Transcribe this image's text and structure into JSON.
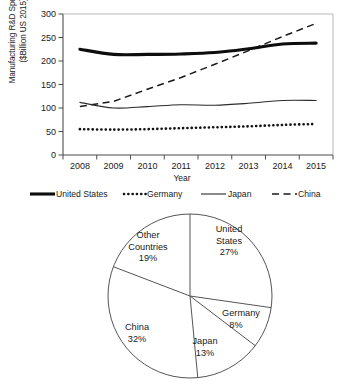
{
  "chart_data": [
    {
      "type": "line",
      "title": "",
      "xlabel": "Year",
      "ylabel": "Manufacturing R&D Spending ($Billion US 2015)",
      "ylabel_line1": "Manufacturing R&D Spending",
      "ylabel_line2": "($Billion US 2015)",
      "x": [
        2008,
        2009,
        2010,
        2011,
        2012,
        2013,
        2014,
        2015
      ],
      "categories": [
        "2008",
        "2009",
        "2010",
        "2011",
        "2012",
        "2013",
        "2014",
        "2015"
      ],
      "xticklabels": [
        "2008",
        "2009",
        "2010",
        "2011",
        "2012",
        "2013",
        "2014",
        "2015"
      ],
      "yticks": [
        0,
        50,
        100,
        150,
        200,
        250,
        300
      ],
      "yticklabels": [
        "0",
        "50",
        "100",
        "150",
        "200",
        "250",
        "300"
      ],
      "ylim": [
        0,
        300
      ],
      "grid": false,
      "legend_position": "below",
      "series": [
        {
          "name": "United States",
          "style": "thick-solid",
          "values": [
            225,
            214,
            214,
            215,
            218,
            226,
            236,
            238
          ]
        },
        {
          "name": "Germany",
          "style": "dotted",
          "values": [
            55,
            54,
            55,
            57,
            59,
            61,
            64,
            66
          ]
        },
        {
          "name": "Japan",
          "style": "thin-solid",
          "values": [
            112,
            100,
            103,
            107,
            106,
            110,
            116,
            116
          ]
        },
        {
          "name": "China",
          "style": "dashed",
          "values": [
            103,
            114,
            140,
            165,
            193,
            222,
            252,
            280
          ]
        }
      ]
    },
    {
      "type": "pie",
      "title": "",
      "labels": [
        "United States",
        "Germany",
        "Japan",
        "China",
        "Other Countries"
      ],
      "values": [
        27,
        8,
        13,
        32,
        19
      ],
      "value_suffix": "%",
      "startangle": 90,
      "direction": "clockwise",
      "slice_labels": [
        {
          "name": "United States",
          "line1": "United",
          "line2": "States",
          "pct": "27%"
        },
        {
          "name": "Germany",
          "line1": "Germany",
          "line2": "",
          "pct": "8%"
        },
        {
          "name": "Japan",
          "line1": "Japan",
          "line2": "",
          "pct": "13%"
        },
        {
          "name": "China",
          "line1": "China",
          "line2": "",
          "pct": "32%"
        },
        {
          "name": "Other Countries",
          "line1": "Other",
          "line2": "Countries",
          "pct": "19%"
        }
      ]
    }
  ],
  "linechart": {
    "ylabel_line1": "Manufacturing R&D Spending",
    "ylabel_line2": "($Billion US 2015)",
    "xlabel": "Year",
    "ytick_0": "0",
    "ytick_50": "50",
    "ytick_100": "100",
    "ytick_150": "150",
    "ytick_200": "200",
    "ytick_250": "250",
    "ytick_300": "300",
    "xtick_2008": "2008",
    "xtick_2009": "2009",
    "xtick_2010": "2010",
    "xtick_2011": "2011",
    "xtick_2012": "2012",
    "xtick_2013": "2013",
    "xtick_2014": "2014",
    "xtick_2015": "2015"
  },
  "legend": {
    "items": [
      {
        "label": "United States",
        "style": "thick-solid"
      },
      {
        "label": "Germany",
        "style": "dotted"
      },
      {
        "label": "Japan",
        "style": "thin-solid"
      },
      {
        "label": "China",
        "style": "dashed"
      }
    ],
    "united_states": "United States",
    "germany": "Germany",
    "japan": "Japan",
    "china": "China"
  },
  "pie": {
    "us_l1": "United",
    "us_l2": "States",
    "us_pct": "27%",
    "germany_l1": "Germany",
    "germany_pct": "8%",
    "japan_l1": "Japan",
    "japan_pct": "13%",
    "china_l1": "China",
    "china_pct": "32%",
    "other_l1": "Other",
    "other_l2": "Countries",
    "other_pct": "19%"
  },
  "colors": {
    "ink": "#1a1a1a",
    "axis": "#4d4d4d",
    "pie_stroke": "#555555",
    "background": "#ffffff"
  }
}
